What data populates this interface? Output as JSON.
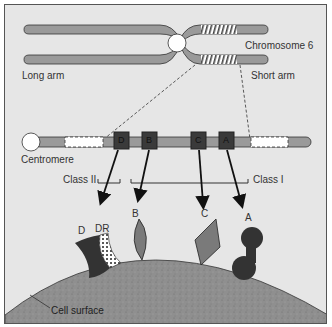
{
  "chromosome": {
    "title": "Chromosome 6",
    "long_arm_label": "Long arm",
    "short_arm_label": "Short arm"
  },
  "expanded": {
    "centromere_label": "Centromere",
    "genes": [
      {
        "id": "D",
        "label": "D"
      },
      {
        "id": "B",
        "label": "B"
      },
      {
        "id": "C",
        "label": "C"
      },
      {
        "id": "A",
        "label": "A"
      }
    ],
    "class2_label": "Class II",
    "class1_label": "Class I"
  },
  "cell": {
    "molecules": [
      {
        "id": "D",
        "label": "D"
      },
      {
        "id": "DR",
        "label": "DR"
      },
      {
        "id": "B",
        "label": "B"
      },
      {
        "id": "C",
        "label": "C"
      },
      {
        "id": "A",
        "label": "A"
      }
    ],
    "surface_label": "Cell surface"
  },
  "colors": {
    "background": "#e6e6e6",
    "chromatid": "#9a9a9a",
    "gene_box": "#3a3a3a",
    "cell": "#8f8f8f",
    "molecule_dark": "#333333",
    "molecule_mid": "#7a7a7a"
  }
}
